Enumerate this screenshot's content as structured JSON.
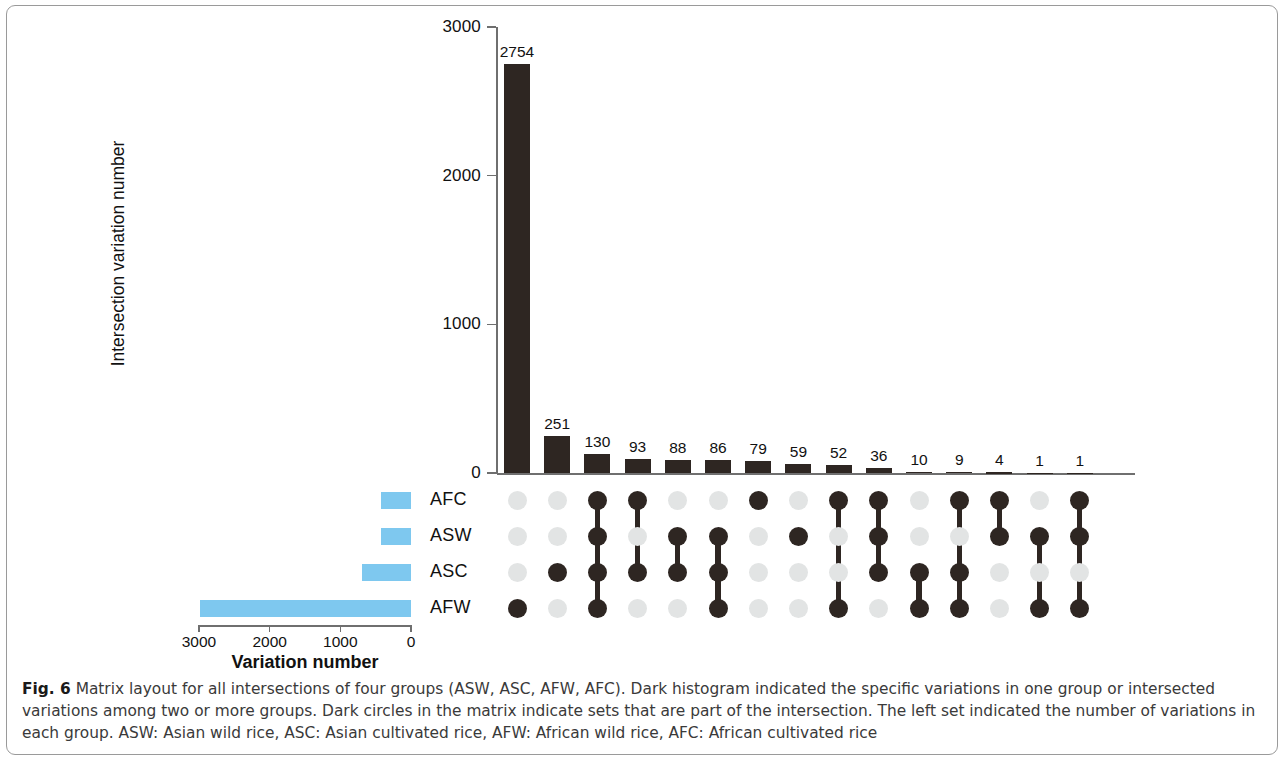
{
  "figure": {
    "label": "Fig. 6",
    "caption": " Matrix layout for all intersections of four groups (ASW, ASC, AFW, AFC). Dark histogram indicated the specific variations in one group or intersected variations among two or more groups. Dark circles in the matrix indicate sets that are part of the intersection. The left set indicated the number of variations in each group. ASW: Asian wild rice, ASC: Asian cultivated rice, AFW: African wild rice, AFC: African cultivated rice"
  },
  "colors": {
    "dark": "#2e2622",
    "light_dot": "#e2e4e4",
    "set_bar_blue": "#7ec8ef",
    "axis": "#6f6f6f"
  },
  "chart_data": {
    "type": "bar",
    "title": "",
    "subtitle": "UpSet matrix layout of intersections among ASW, ASC, AFW, AFC",
    "ylabel": "Intersection variation number",
    "xlabel": "",
    "ylim": [
      0,
      3000
    ],
    "yticks": [
      0,
      1000,
      2000,
      3000
    ],
    "ytick_labels": [
      "0",
      "1000",
      "2000",
      "3000"
    ],
    "grid": false,
    "legend": "none",
    "sets": [
      "AFC",
      "ASW",
      "ASC",
      "AFW"
    ],
    "categories": [
      "AFW",
      "ASC",
      "AFC+ASW+ASC+AFW",
      "AFC+ASC",
      "ASW+ASC",
      "ASW+ASC+AFW",
      "AFC",
      "ASW",
      "AFC+AFW",
      "AFC+ASW+ASC",
      "ASC+AFW",
      "AFC+ASC+AFW",
      "AFC+ASW",
      "ASW+AFW",
      "AFC+ASW+AFW"
    ],
    "values": [
      2754,
      251,
      130,
      93,
      88,
      86,
      79,
      59,
      52,
      36,
      10,
      9,
      4,
      1,
      1
    ],
    "value_labels": [
      "2754",
      "251",
      "130",
      "93",
      "88",
      "86",
      "79",
      "59",
      "52",
      "36",
      "10",
      "9",
      "4",
      "1",
      "1"
    ],
    "membership": [
      [
        false,
        false,
        false,
        true
      ],
      [
        false,
        false,
        true,
        false
      ],
      [
        true,
        true,
        true,
        true
      ],
      [
        true,
        false,
        true,
        false
      ],
      [
        false,
        true,
        true,
        false
      ],
      [
        false,
        true,
        true,
        true
      ],
      [
        true,
        false,
        false,
        false
      ],
      [
        false,
        true,
        false,
        false
      ],
      [
        true,
        false,
        false,
        true
      ],
      [
        true,
        true,
        true,
        false
      ],
      [
        false,
        false,
        true,
        true
      ],
      [
        true,
        false,
        true,
        true
      ],
      [
        true,
        true,
        false,
        false
      ],
      [
        false,
        true,
        false,
        true
      ],
      [
        true,
        true,
        false,
        true
      ]
    ],
    "set_sizes": {
      "xlabel": "Variation number",
      "xticks": [
        3000,
        2000,
        1000,
        0
      ],
      "xtick_labels": [
        "3000",
        "2000",
        "1000",
        "0"
      ],
      "xlim": [
        0,
        3000
      ],
      "direction": "right-to-left",
      "names": [
        "AFC",
        "ASW",
        "ASC",
        "AFW"
      ],
      "values": [
        420,
        420,
        700,
        2980
      ]
    }
  }
}
